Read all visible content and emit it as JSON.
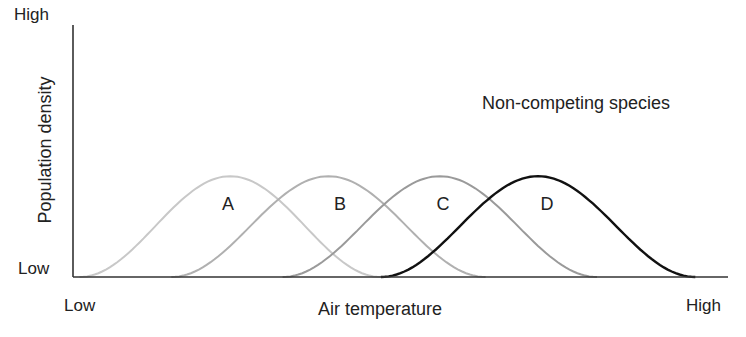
{
  "chart_data": {
    "type": "line",
    "title": "",
    "annotation": "Non-competing species",
    "xlabel": "Air temperature",
    "ylabel": "Population density",
    "x_ticks": [
      "Low",
      "High"
    ],
    "y_ticks": [
      "Low",
      "High"
    ],
    "grid": false,
    "legend": "none (curves labeled inline)",
    "xlim": [
      0,
      100
    ],
    "ylim": [
      0,
      100
    ],
    "series": [
      {
        "name": "A",
        "color": "#c8c8c8",
        "start": 1,
        "peak_x": 24,
        "peak_y": 40,
        "end": 47
      },
      {
        "name": "B",
        "color": "#b0b0b0",
        "start": 15,
        "peak_x": 39,
        "peak_y": 40,
        "end": 63
      },
      {
        "name": "C",
        "color": "#9a9a9a",
        "start": 32,
        "peak_x": 56,
        "peak_y": 40,
        "end": 80
      },
      {
        "name": "D",
        "color": "#111111",
        "start": 47,
        "peak_x": 71,
        "peak_y": 40,
        "end": 95
      }
    ]
  },
  "labels": {
    "y_high": "High",
    "y_low": "Low",
    "x_low": "Low",
    "x_high": "High",
    "x_axis": "Air temperature",
    "y_axis": "Population density",
    "annotation": "Non-competing species",
    "curve_a": "A",
    "curve_b": "B",
    "curve_c": "C",
    "curve_d": "D"
  }
}
